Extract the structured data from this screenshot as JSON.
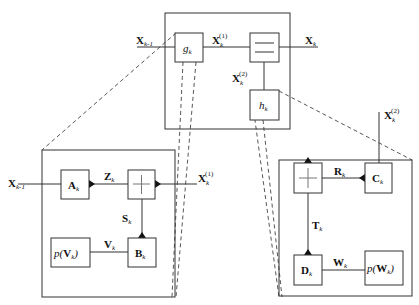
{
  "diagram": {
    "top": {
      "input_label": "X",
      "input_sub": "k-1",
      "g_label": "g",
      "g_sub": "k",
      "mid_label": "X",
      "mid_sub": "k",
      "mid_sup": "(1)",
      "out_label": "X",
      "out_sub": "k",
      "branch_label": "X",
      "branch_sub": "k",
      "branch_sup": "(2)",
      "h_label": "h",
      "h_sub": "k",
      "split_symbol": "equals"
    },
    "left_detail": {
      "input_label": "X",
      "input_sub": "k-1",
      "a_label": "A",
      "a_sub": "k",
      "z_label": "Z",
      "z_sub": "k",
      "sum_symbol": "plus",
      "out_label": "X",
      "out_sub": "k",
      "out_sup": "(1)",
      "s_label": "S",
      "s_sub": "k",
      "b_label": "B",
      "b_sub": "k",
      "v_label": "V",
      "v_sub": "k",
      "pv_prefix": "p(",
      "pv_var": "V",
      "pv_sub": "k",
      "pv_suffix": ")"
    },
    "right_detail": {
      "in_label": "X",
      "in_sub": "k",
      "in_sup": "(2)",
      "c_label": "C",
      "c_sub": "k",
      "r_label": "R",
      "r_sub": "k",
      "sum_symbol": "plus",
      "t_label": "T",
      "t_sub": "k",
      "d_label": "D",
      "d_sub": "k",
      "w_label": "W",
      "w_sub": "k",
      "pw_prefix": "p(",
      "pw_var": "W",
      "pw_sub": "k",
      "pw_suffix": ")"
    }
  }
}
